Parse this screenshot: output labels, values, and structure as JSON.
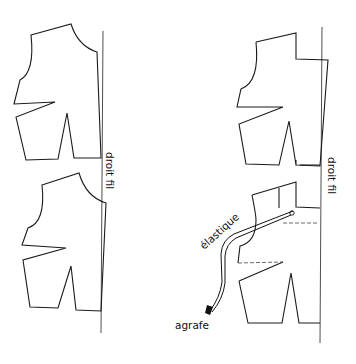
{
  "diagram": {
    "labels": {
      "grain_left": "droit fil",
      "grain_right": "droit fil",
      "elastic": "élastique",
      "hook": "agrafe"
    },
    "colors": {
      "line": "#1a1a1a",
      "background": "#ffffff"
    },
    "pieces": [
      {
        "id": "top-left-bodice",
        "position": "top-left"
      },
      {
        "id": "bottom-left-bodice",
        "position": "bottom-left"
      },
      {
        "id": "top-right-bodice",
        "position": "top-right"
      },
      {
        "id": "bottom-right-bodice",
        "position": "bottom-right",
        "has_elastic": true
      }
    ]
  }
}
